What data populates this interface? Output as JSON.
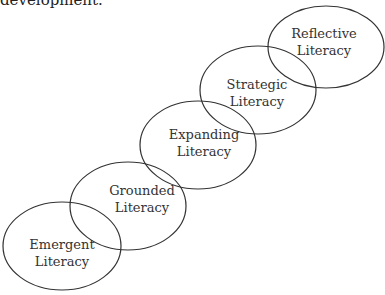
{
  "caption": "development.",
  "diagram": {
    "stages": [
      {
        "label": "Emergent",
        "label2": "Literacy",
        "cx": 62,
        "cy": 246,
        "rx": 59,
        "ry": 44
      },
      {
        "label": "Grounded",
        "label2": "Literacy",
        "cx": 128,
        "cy": 206,
        "rx": 58,
        "ry": 44
      },
      {
        "label": "Expanding",
        "label2": "Literacy",
        "cx": 198,
        "cy": 145,
        "rx": 58,
        "ry": 44
      },
      {
        "label": "Strategic",
        "label2": "Literacy",
        "cx": 258,
        "cy": 90,
        "rx": 58,
        "ry": 44
      },
      {
        "label": "Reflective",
        "label2": "Literacy",
        "cx": 326,
        "cy": 47,
        "rx": 58,
        "ry": 41
      }
    ],
    "stroke_color": "#333333"
  }
}
